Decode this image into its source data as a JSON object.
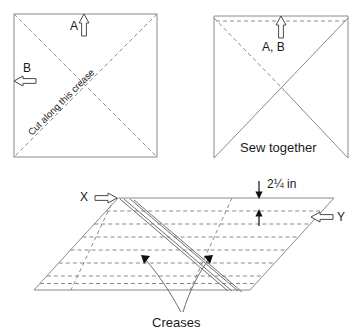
{
  "figure": {
    "panels": [
      {
        "id": "panel-left",
        "name": "cut-square",
        "shape": "square",
        "labels": {
          "arrow_a": "A",
          "arrow_b": "B",
          "crease_instruction": "Cut along this crease"
        },
        "arrows": [
          {
            "name": "arrow-a-up",
            "label": "A",
            "direction": "up",
            "style": "hollow"
          },
          {
            "name": "arrow-b-left",
            "label": "B",
            "direction": "left",
            "style": "hollow"
          }
        ],
        "diagonals": "both, dashed"
      },
      {
        "id": "panel-right",
        "name": "sew-square",
        "shape": "square",
        "labels": {
          "arrow_ab": "A, B",
          "instruction": "Sew together"
        },
        "arrows": [
          {
            "name": "arrow-ab-up",
            "label": "A, B",
            "direction": "up",
            "style": "hollow"
          }
        ],
        "diagonals": "both; top-left-to-center dashed, others solid"
      },
      {
        "id": "panel-bottom",
        "name": "creases-parallelogram",
        "shape": "parallelogram",
        "labels": {
          "corner_x": "X",
          "corner_y": "Y",
          "dimension": "2¼ in",
          "creases": "Creases"
        },
        "arrows": [
          {
            "name": "arrow-x-right",
            "label": "X",
            "direction": "right",
            "style": "hollow"
          },
          {
            "name": "arrow-y-left",
            "label": "Y",
            "direction": "left",
            "style": "hollow"
          }
        ],
        "crease_rows": 7,
        "crease_columns": 2,
        "dimension_value": "2¼ in"
      }
    ],
    "colors": {
      "line": "#8a8a8a",
      "fold": "#6f6f6f",
      "text": "#1a1a1a",
      "arrow_fill": "#ffffff",
      "arrow_stroke": "#4a4a4a",
      "background": "#ffffff"
    }
  }
}
